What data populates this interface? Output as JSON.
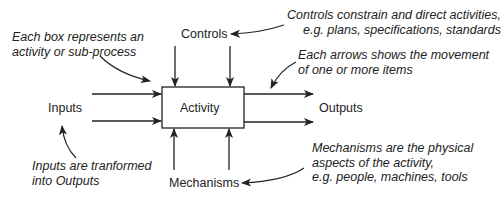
{
  "diagram": {
    "activity_label": "Activity",
    "controls_label": "Controls",
    "inputs_label": "Inputs",
    "outputs_label": "Outputs",
    "mechanisms_label": "Mechanisms",
    "notes": {
      "box": [
        "Each box represents an",
        "activity or sub-process"
      ],
      "controls": [
        "Controls constrain and direct activities,",
        "e.g. plans, specifications, standards"
      ],
      "arrows": [
        "Each arrows shows the movement",
        "of one or more items"
      ],
      "inputs": [
        "Inputs are tranformed",
        "into Outputs"
      ],
      "mechanisms": [
        "Mechanisms are the physical",
        "aspects of the activity,",
        "e.g. people, machines, tools"
      ]
    },
    "colors": {
      "line": "#222222",
      "background": "#ffffff"
    }
  }
}
